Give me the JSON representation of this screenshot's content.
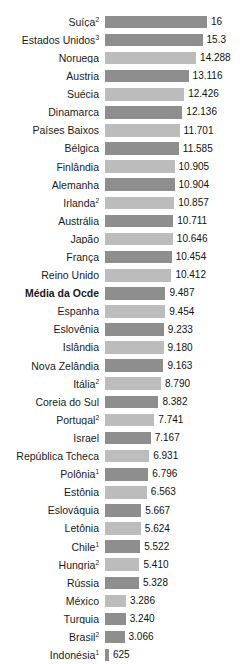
{
  "title_remnant": "",
  "colors": {
    "bar_dark": "#8e8e8e",
    "bar_light": "#bcbcbc",
    "text": "#111111",
    "background": "#ffffff"
  },
  "chart_data": {
    "type": "bar",
    "orientation": "horizontal",
    "title": "",
    "subtitle": "",
    "xlabel": "",
    "ylabel": "",
    "grid": false,
    "legend": null,
    "xlim": [
      0,
      16
    ],
    "highlight_row": "Média da Ocde",
    "value_format": "pt-BR (ponto como separador de milhar)",
    "categories": [
      "Suíça",
      "Estados Unidos",
      "Noruega",
      "Áustria",
      "Suécia",
      "Dinamarca",
      "Países Baixos",
      "Bélgica",
      "Finlândia",
      "Alemanha",
      "Irlanda",
      "Austrália",
      "Japão",
      "França",
      "Reino Unido",
      "Média da Ocde",
      "Espanha",
      "Eslovênia",
      "Islândia",
      "Nova Zelândia",
      "Itália",
      "Coreia do Sul",
      "Portugal",
      "Israel",
      "República Tcheca",
      "Polônia",
      "Estônia",
      "Eslováquia",
      "Letônia",
      "Chile",
      "Hungria",
      "Rússia",
      "México",
      "Turquia",
      "Brasil",
      "Indonésia"
    ],
    "values": [
      16,
      15.3,
      14288,
      13116,
      12426,
      12136,
      11701,
      11585,
      10905,
      10904,
      10857,
      10711,
      10646,
      10454,
      10412,
      9487,
      9454,
      9233,
      9180,
      9163,
      8790,
      8382,
      7741,
      7167,
      6931,
      6796,
      6563,
      5667,
      5624,
      5522,
      5410,
      5328,
      3286,
      3240,
      3066,
      625
    ],
    "rows": [
      {
        "label": "Suíça",
        "footnote": "2",
        "value_text": "16",
        "value": 16000,
        "shade": "dark",
        "bold": false
      },
      {
        "label": "Estados Unidos",
        "footnote": "3",
        "value_text": "15.3",
        "value": 15300,
        "shade": "dark",
        "bold": false
      },
      {
        "label": "Noruega",
        "footnote": "",
        "value_text": "14.288",
        "value": 14288,
        "shade": "light",
        "bold": false
      },
      {
        "label": "Áustria",
        "footnote": "",
        "value_text": "13.116",
        "value": 13116,
        "shade": "dark",
        "bold": false
      },
      {
        "label": "Suécia",
        "footnote": "",
        "value_text": "12.426",
        "value": 12426,
        "shade": "light",
        "bold": false
      },
      {
        "label": "Dinamarca",
        "footnote": "",
        "value_text": "12.136",
        "value": 12136,
        "shade": "dark",
        "bold": false
      },
      {
        "label": "Países Baixos",
        "footnote": "",
        "value_text": "11.701",
        "value": 11701,
        "shade": "light",
        "bold": false
      },
      {
        "label": "Bélgica",
        "footnote": "",
        "value_text": "11.585",
        "value": 11585,
        "shade": "dark",
        "bold": false
      },
      {
        "label": "Finlândia",
        "footnote": "",
        "value_text": "10.905",
        "value": 10905,
        "shade": "light",
        "bold": false
      },
      {
        "label": "Alemanha",
        "footnote": "",
        "value_text": "10.904",
        "value": 10904,
        "shade": "dark",
        "bold": false
      },
      {
        "label": "Irlanda",
        "footnote": "2",
        "value_text": "10.857",
        "value": 10857,
        "shade": "light",
        "bold": false
      },
      {
        "label": "Austrália",
        "footnote": "",
        "value_text": "10.711",
        "value": 10711,
        "shade": "dark",
        "bold": false
      },
      {
        "label": "Japão",
        "footnote": "",
        "value_text": "10.646",
        "value": 10646,
        "shade": "light",
        "bold": false
      },
      {
        "label": "França",
        "footnote": "",
        "value_text": "10.454",
        "value": 10454,
        "shade": "dark",
        "bold": false
      },
      {
        "label": "Reino Unido",
        "footnote": "",
        "value_text": "10.412",
        "value": 10412,
        "shade": "light",
        "bold": false
      },
      {
        "label": "Média da Ocde",
        "footnote": "",
        "value_text": "9.487",
        "value": 9487,
        "shade": "dark",
        "bold": true
      },
      {
        "label": "Espanha",
        "footnote": "",
        "value_text": "9.454",
        "value": 9454,
        "shade": "light",
        "bold": false
      },
      {
        "label": "Eslovênia",
        "footnote": "",
        "value_text": "9.233",
        "value": 9233,
        "shade": "dark",
        "bold": false
      },
      {
        "label": "Islândia",
        "footnote": "",
        "value_text": "9.180",
        "value": 9180,
        "shade": "light",
        "bold": false
      },
      {
        "label": "Nova Zelândia",
        "footnote": "",
        "value_text": "9.163",
        "value": 9163,
        "shade": "dark",
        "bold": false
      },
      {
        "label": "Itália",
        "footnote": "2",
        "value_text": "8.790",
        "value": 8790,
        "shade": "light",
        "bold": false
      },
      {
        "label": "Coreia do Sul",
        "footnote": "",
        "value_text": "8.382",
        "value": 8382,
        "shade": "dark",
        "bold": false
      },
      {
        "label": "Portugal",
        "footnote": "2",
        "value_text": "7.741",
        "value": 7741,
        "shade": "light",
        "bold": false
      },
      {
        "label": "Israel",
        "footnote": "",
        "value_text": "7.167",
        "value": 7167,
        "shade": "dark",
        "bold": false
      },
      {
        "label": "República Tcheca",
        "footnote": "",
        "value_text": "6.931",
        "value": 6931,
        "shade": "light",
        "bold": false
      },
      {
        "label": "Polônia",
        "footnote": "1",
        "value_text": "6.796",
        "value": 6796,
        "shade": "dark",
        "bold": false
      },
      {
        "label": "Estônia",
        "footnote": "",
        "value_text": "6.563",
        "value": 6563,
        "shade": "light",
        "bold": false
      },
      {
        "label": "Eslováquia",
        "footnote": "",
        "value_text": "5.667",
        "value": 5667,
        "shade": "dark",
        "bold": false
      },
      {
        "label": "Letônia",
        "footnote": "",
        "value_text": "5.624",
        "value": 5624,
        "shade": "light",
        "bold": false
      },
      {
        "label": "Chile",
        "footnote": "1",
        "value_text": "5.522",
        "value": 5522,
        "shade": "dark",
        "bold": false
      },
      {
        "label": "Hungria",
        "footnote": "2",
        "value_text": "5.410",
        "value": 5410,
        "shade": "light",
        "bold": false
      },
      {
        "label": "Rússia",
        "footnote": "",
        "value_text": "5.328",
        "value": 5328,
        "shade": "dark",
        "bold": false
      },
      {
        "label": "México",
        "footnote": "",
        "value_text": "3.286",
        "value": 3286,
        "shade": "light",
        "bold": false
      },
      {
        "label": "Turquia",
        "footnote": "",
        "value_text": "3.240",
        "value": 3240,
        "shade": "dark",
        "bold": false
      },
      {
        "label": "Brasil",
        "footnote": "2",
        "value_text": "3.066",
        "value": 3066,
        "shade": "dark",
        "bold": false
      },
      {
        "label": "Indonésia",
        "footnote": "1",
        "value_text": "625",
        "value": 625,
        "shade": "dark",
        "bold": false
      }
    ]
  }
}
